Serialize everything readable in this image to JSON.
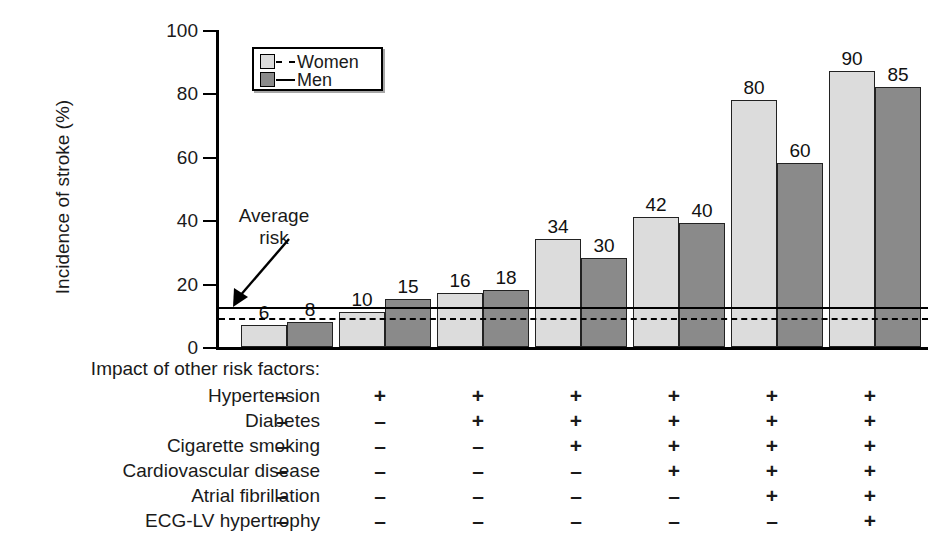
{
  "chart_data": {
    "type": "bar",
    "title": "",
    "xlabel": "",
    "ylabel": "Incidence of stroke (%)",
    "ylim": [
      0,
      100
    ],
    "yticks": [
      0,
      20,
      40,
      60,
      80,
      100
    ],
    "grid": false,
    "legend_position": "top-left",
    "categories": [
      "1",
      "2",
      "3",
      "4",
      "5",
      "6",
      "7"
    ],
    "series": [
      {
        "name": "Women",
        "color": "#dcdcdc",
        "values": [
          6,
          10,
          16,
          34,
          42,
          80,
          90
        ],
        "bar_heights": [
          7,
          11,
          17,
          34,
          41,
          78,
          87
        ]
      },
      {
        "name": "Men",
        "color": "#8a8a8a",
        "values": [
          8,
          15,
          18,
          30,
          40,
          60,
          85
        ],
        "bar_heights": [
          8,
          15,
          18,
          28,
          39,
          58,
          82
        ]
      }
    ],
    "reference_lines": [
      {
        "name": "Average risk - Men",
        "value": 12.5,
        "style": "solid"
      },
      {
        "name": "Average risk - Women",
        "value": 9,
        "style": "dashed"
      }
    ],
    "annotations": [
      {
        "name": "average-risk",
        "text_line1": "Average",
        "text_line2": "risk"
      }
    ],
    "risk_matrix": {
      "heading": "Impact of other risk factors:",
      "rows": [
        {
          "label": "Hypertension",
          "cells": [
            "–",
            "+",
            "+",
            "+",
            "+",
            "+",
            "+"
          ]
        },
        {
          "label": "Diabetes",
          "cells": [
            "–",
            "–",
            "+",
            "+",
            "+",
            "+",
            "+"
          ]
        },
        {
          "label": "Cigarette smoking",
          "cells": [
            "–",
            "–",
            "–",
            "+",
            "+",
            "+",
            "+"
          ]
        },
        {
          "label": "Cardiovascular disease",
          "cells": [
            "–",
            "–",
            "–",
            "–",
            "+",
            "+",
            "+"
          ]
        },
        {
          "label": "Atrial fibrillation",
          "cells": [
            "–",
            "–",
            "–",
            "–",
            "–",
            "+",
            "+"
          ]
        },
        {
          "label": "ECG-LV hypertrophy",
          "cells": [
            "–",
            "–",
            "–",
            "–",
            "–",
            "–",
            "+"
          ]
        }
      ]
    }
  },
  "legend": {
    "women_label": "Women",
    "men_label": "Men"
  },
  "axis": {
    "y_title": "Incidence of stroke (%)",
    "tick_labels": [
      "100",
      "80",
      "60",
      "40",
      "20",
      "0"
    ]
  },
  "annotation": {
    "average_risk_line1": "Average",
    "average_risk_line2": "risk"
  },
  "matrix": {
    "heading": "Impact of other risk factors:"
  }
}
